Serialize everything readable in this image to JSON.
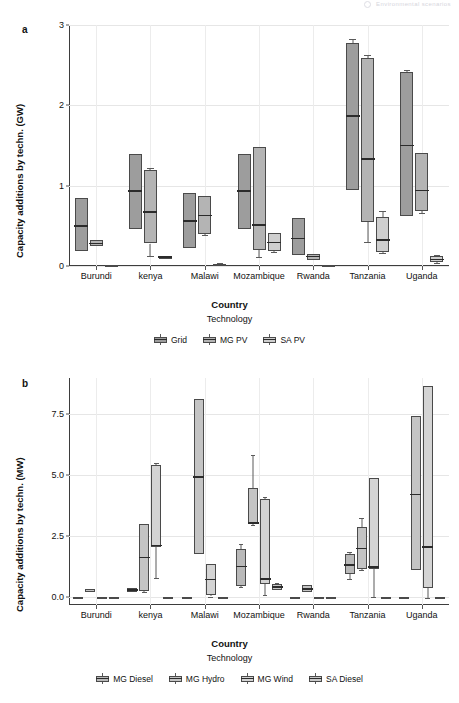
{
  "running_header": "Environmental scenarios",
  "panels": [
    {
      "letter": "a",
      "ylabel": "Capacity additions by techn. (GW)",
      "xlabel": "Country",
      "legend_title": "Technology",
      "yticks": [
        "0",
        "1",
        "2",
        "3"
      ]
    },
    {
      "letter": "b",
      "ylabel": "Capacity additions by techn. (MW)",
      "xlabel": "Country",
      "legend_title": "Technology",
      "yticks": [
        "0.0",
        "2.5",
        "5.0",
        "7.5"
      ]
    }
  ],
  "chart_data": [
    {
      "type": "box",
      "panel": "a",
      "title": "",
      "xlabel": "Country",
      "ylabel": "Capacity additions by techn. (GW)",
      "ylim": [
        0,
        3
      ],
      "yticks": [
        0,
        1,
        2,
        3
      ],
      "grid": true,
      "legend_title": "Technology",
      "legend_position": "bottom",
      "categories": [
        "Burundi",
        "kenya",
        "Malawi",
        "Mozambique",
        "Rwanda",
        "Tanzania",
        "Uganda"
      ],
      "series": [
        {
          "name": "Grid",
          "color": "#9d9d9d",
          "boxes": [
            {
              "category": "Burundi",
              "whisker_low": 0.19,
              "q1": 0.19,
              "median": 0.5,
              "q3": 0.85,
              "whisker_high": 0.85
            },
            {
              "category": "kenya",
              "whisker_low": 0.46,
              "q1": 0.46,
              "median": 0.93,
              "q3": 1.39,
              "whisker_high": 1.39
            },
            {
              "category": "Malawi",
              "whisker_low": 0.22,
              "q1": 0.22,
              "median": 0.56,
              "q3": 0.91,
              "whisker_high": 0.91
            },
            {
              "category": "Mozambique",
              "whisker_low": 0.46,
              "q1": 0.46,
              "median": 0.93,
              "q3": 1.39,
              "whisker_high": 1.39
            },
            {
              "category": "Rwanda",
              "whisker_low": 0.14,
              "q1": 0.14,
              "median": 0.34,
              "q3": 0.6,
              "whisker_high": 0.6
            },
            {
              "category": "Tanzania",
              "whisker_low": 0.95,
              "q1": 0.95,
              "median": 1.87,
              "q3": 2.78,
              "whisker_high": 2.82
            },
            {
              "category": "Uganda",
              "whisker_low": 0.62,
              "q1": 0.62,
              "median": 1.5,
              "q3": 2.41,
              "whisker_high": 2.44
            }
          ]
        },
        {
          "name": "MG PV",
          "color": "#b4b4b4",
          "boxes": [
            {
              "category": "Burundi",
              "whisker_low": 0.25,
              "q1": 0.25,
              "median": 0.28,
              "q3": 0.32,
              "whisker_high": 0.32
            },
            {
              "category": "kenya",
              "whisker_low": 0.12,
              "q1": 0.28,
              "median": 0.67,
              "q3": 1.19,
              "whisker_high": 1.22
            },
            {
              "category": "Malawi",
              "whisker_low": 0.38,
              "q1": 0.4,
              "median": 0.63,
              "q3": 0.87,
              "whisker_high": 0.87
            },
            {
              "category": "Mozambique",
              "whisker_low": 0.11,
              "q1": 0.2,
              "median": 0.51,
              "q3": 1.48,
              "whisker_high": 1.48
            },
            {
              "category": "Rwanda",
              "whisker_low": 0.08,
              "q1": 0.08,
              "median": 0.12,
              "q3": 0.15,
              "whisker_high": 0.15
            },
            {
              "category": "Tanzania",
              "whisker_low": 0.3,
              "q1": 0.55,
              "median": 1.33,
              "q3": 2.59,
              "whisker_high": 2.63
            },
            {
              "category": "Uganda",
              "whisker_low": 0.66,
              "q1": 0.68,
              "median": 0.94,
              "q3": 1.41,
              "whisker_high": 1.41
            }
          ]
        },
        {
          "name": "SA PV",
          "color": "#cfcfcf",
          "boxes": [
            {
              "category": "Burundi",
              "whisker_low": -0.01,
              "q1": -0.01,
              "median": 0.0,
              "q3": 0.01,
              "whisker_high": 0.01
            },
            {
              "category": "kenya",
              "whisker_low": 0.09,
              "q1": 0.09,
              "median": 0.11,
              "q3": 0.13,
              "whisker_high": 0.13
            },
            {
              "category": "Malawi",
              "whisker_low": 0.0,
              "q1": 0.0,
              "median": 0.02,
              "q3": 0.03,
              "whisker_high": 0.04
            },
            {
              "category": "Mozambique",
              "whisker_low": 0.17,
              "q1": 0.19,
              "median": 0.29,
              "q3": 0.41,
              "whisker_high": 0.41
            },
            {
              "category": "Rwanda",
              "whisker_low": -0.01,
              "q1": -0.01,
              "median": 0.0,
              "q3": 0.01,
              "whisker_high": 0.01
            },
            {
              "category": "Tanzania",
              "whisker_low": 0.16,
              "q1": 0.17,
              "median": 0.32,
              "q3": 0.61,
              "whisker_high": 0.69
            },
            {
              "category": "Uganda",
              "whisker_low": 0.04,
              "q1": 0.05,
              "median": 0.08,
              "q3": 0.12,
              "whisker_high": 0.14
            }
          ]
        }
      ]
    },
    {
      "type": "box",
      "panel": "b",
      "title": "",
      "xlabel": "Country",
      "ylabel": "Capacity additions by techn. (MW)",
      "ylim": [
        -0.35,
        9.0
      ],
      "yticks": [
        0.0,
        2.5,
        5.0,
        7.5
      ],
      "grid": true,
      "legend_title": "Technology",
      "legend_position": "bottom",
      "categories": [
        "Burundi",
        "kenya",
        "Malawi",
        "Mozambique",
        "Rwanda",
        "Tanzania",
        "Uganda"
      ],
      "series": [
        {
          "name": "MG Diesel",
          "color": "#b9b9b9",
          "boxes": [
            {
              "category": "Burundi",
              "whisker_low": -0.04,
              "q1": -0.04,
              "median": -0.02,
              "q3": 0.0,
              "whisker_high": 0.0
            },
            {
              "category": "kenya",
              "whisker_low": 0.18,
              "q1": 0.2,
              "median": 0.26,
              "q3": 0.33,
              "whisker_high": 0.33
            },
            {
              "category": "Malawi",
              "whisker_low": -0.04,
              "q1": -0.04,
              "median": -0.02,
              "q3": 0.0,
              "whisker_high": 0.0
            },
            {
              "category": "Mozambique",
              "whisker_low": 0.38,
              "q1": 0.45,
              "median": 1.23,
              "q3": 1.95,
              "whisker_high": 2.17
            },
            {
              "category": "Rwanda",
              "whisker_low": -0.04,
              "q1": -0.04,
              "median": -0.02,
              "q3": 0.0,
              "whisker_high": 0.0
            },
            {
              "category": "Tanzania",
              "whisker_low": 0.72,
              "q1": 0.92,
              "median": 1.29,
              "q3": 1.77,
              "whisker_high": 1.83
            },
            {
              "category": "Uganda",
              "whisker_low": -0.06,
              "q1": -0.06,
              "median": -0.04,
              "q3": -0.02,
              "whisker_high": -0.02
            }
          ]
        },
        {
          "name": "MG Hydro",
          "color": "#c4c4c4",
          "boxes": [
            {
              "category": "Burundi",
              "whisker_low": 0.16,
              "q1": 0.17,
              "median": 0.23,
              "q3": 0.29,
              "whisker_high": 0.29
            },
            {
              "category": "kenya",
              "whisker_low": 0.18,
              "q1": 0.22,
              "median": 1.6,
              "q3": 2.98,
              "whisker_high": 2.98
            },
            {
              "category": "Malawi",
              "whisker_low": 1.75,
              "q1": 1.75,
              "median": 4.92,
              "q3": 8.12,
              "whisker_high": 8.12
            },
            {
              "category": "Mozambique",
              "whisker_low": 2.95,
              "q1": 2.99,
              "median": 3.02,
              "q3": 4.45,
              "whisker_high": 5.82
            },
            {
              "category": "Rwanda",
              "whisker_low": 0.17,
              "q1": 0.19,
              "median": 0.31,
              "q3": 0.46,
              "whisker_high": 0.46
            },
            {
              "category": "Tanzania",
              "whisker_low": 1.1,
              "q1": 1.14,
              "median": 1.97,
              "q3": 2.86,
              "whisker_high": 3.22
            },
            {
              "category": "Uganda",
              "whisker_low": 1.1,
              "q1": 1.1,
              "median": 4.2,
              "q3": 7.42,
              "whisker_high": 7.42
            }
          ]
        },
        {
          "name": "MG Wind",
          "color": "#d4d4d4",
          "boxes": [
            {
              "category": "Burundi",
              "whisker_low": -0.04,
              "q1": -0.04,
              "median": -0.02,
              "q3": 0.0,
              "whisker_high": 0.0
            },
            {
              "category": "kenya",
              "whisker_low": 0.78,
              "q1": 2.03,
              "median": 2.1,
              "q3": 5.42,
              "whisker_high": 5.48
            },
            {
              "category": "Malawi",
              "whisker_low": 0.0,
              "q1": 0.05,
              "median": 0.7,
              "q3": 1.35,
              "whisker_high": 1.35
            },
            {
              "category": "Mozambique",
              "whisker_low": 0.05,
              "q1": 0.52,
              "median": 0.71,
              "q3": 4.02,
              "whisker_high": 4.1
            },
            {
              "category": "Rwanda",
              "whisker_low": -0.04,
              "q1": -0.04,
              "median": -0.02,
              "q3": 0.0,
              "whisker_high": 0.0
            },
            {
              "category": "Tanzania",
              "whisker_low": -0.02,
              "q1": 1.12,
              "median": 1.22,
              "q3": 4.9,
              "whisker_high": 4.92
            },
            {
              "category": "Uganda",
              "whisker_low": -0.08,
              "q1": 0.35,
              "median": 2.04,
              "q3": 8.68,
              "whisker_high": 8.68
            }
          ]
        },
        {
          "name": "SA Diesel",
          "color": "#c9c9c9",
          "boxes": [
            {
              "category": "Burundi",
              "whisker_low": -0.04,
              "q1": -0.04,
              "median": -0.02,
              "q3": 0.0,
              "whisker_high": 0.0
            },
            {
              "category": "kenya",
              "whisker_low": -0.04,
              "q1": -0.04,
              "median": -0.02,
              "q3": 0.0,
              "whisker_high": 0.0
            },
            {
              "category": "Malawi",
              "whisker_low": -0.04,
              "q1": -0.04,
              "median": -0.02,
              "q3": 0.0,
              "whisker_high": 0.0
            },
            {
              "category": "Mozambique",
              "whisker_low": 0.26,
              "q1": 0.28,
              "median": 0.38,
              "q3": 0.5,
              "whisker_high": 0.54
            },
            {
              "category": "Rwanda",
              "whisker_low": -0.04,
              "q1": -0.04,
              "median": -0.02,
              "q3": 0.0,
              "whisker_high": 0.0
            },
            {
              "category": "Tanzania",
              "whisker_low": -0.05,
              "q1": -0.05,
              "median": -0.03,
              "q3": -0.01,
              "whisker_high": -0.01
            },
            {
              "category": "Uganda",
              "whisker_low": -0.06,
              "q1": -0.06,
              "median": -0.04,
              "q3": -0.02,
              "whisker_high": -0.02
            }
          ]
        }
      ]
    }
  ]
}
